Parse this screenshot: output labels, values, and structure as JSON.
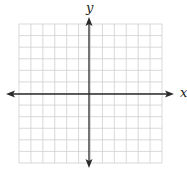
{
  "chart_data": {
    "type": "coordinate-grid",
    "title": "",
    "xlabel": "x",
    "ylabel": "y",
    "grid": {
      "columns": 12,
      "rows": 12,
      "left_px": 19,
      "top_px": 24,
      "right_px": 162,
      "bottom_px": 163,
      "line_color": "#cfcfcf"
    },
    "axes": {
      "origin_px": [
        89,
        94
      ],
      "x_axis": {
        "from_px": 6,
        "to_px": 174,
        "arrows": "both"
      },
      "y_axis": {
        "from_px": 17,
        "to_px": 168,
        "arrows": "both"
      },
      "color": "#2a2a2a"
    },
    "ticks_labeled": false,
    "data_points": []
  },
  "labels": {
    "x": "x",
    "y": "y"
  }
}
